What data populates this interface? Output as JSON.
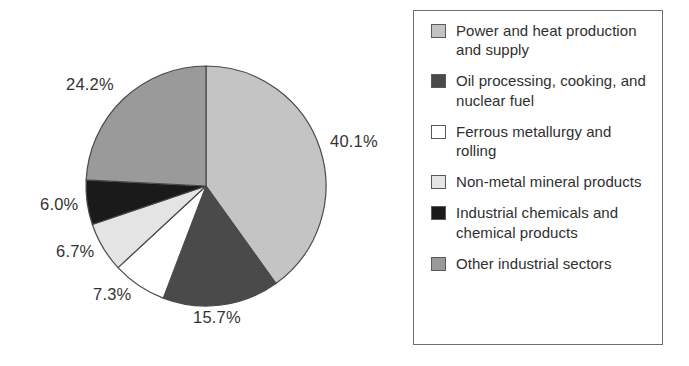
{
  "chart_data": {
    "type": "pie",
    "title": "",
    "subtitle": "",
    "xlabel": "",
    "ylabel": "",
    "units": "percent",
    "start_angle_deg": 0,
    "direction": "clockwise",
    "grid": false,
    "legend_position": "right",
    "legend_border": true,
    "categories": [
      "Power and heat production and supply",
      "Oil processing, cooking, and nuclear fuel",
      "Ferrous metallurgy and rolling",
      "Non-metal mineral products",
      "Industrial chemicals and chemical products",
      "Other industrial sectors"
    ],
    "values": [
      40.1,
      15.7,
      7.3,
      6.7,
      6.0,
      24.2
    ],
    "value_labels": [
      "40.1%",
      "15.7%",
      "7.3%",
      "6.7%",
      "6.0%",
      "24.2%"
    ],
    "colors": [
      "#c4c4c4",
      "#4a4a4a",
      "#ffffff",
      "#e4e4e4",
      "#1a1a1a",
      "#9a9a9a"
    ],
    "slice_outline_color": "#4a4a4a",
    "total": 100.0
  },
  "pie": {
    "center_x": 206,
    "center_y": 186,
    "radius": 120,
    "labels": [
      {
        "text": "24.2%",
        "x": 66,
        "y": 76
      },
      {
        "text": "40.1%",
        "x": 330,
        "y": 133
      },
      {
        "text": "6.0%",
        "x": 40,
        "y": 196
      },
      {
        "text": "6.7%",
        "x": 56,
        "y": 243
      },
      {
        "text": "7.3%",
        "x": 93,
        "y": 286
      },
      {
        "text": "15.7%",
        "x": 193,
        "y": 309
      }
    ]
  },
  "legend": {
    "items": [
      {
        "label": "Power and heat production and supply",
        "color": "#c4c4c4",
        "swatch_name": "legend-swatch-power-and-heat"
      },
      {
        "label": "Oil processing, cooking, and nuclear fuel",
        "color": "#4a4a4a",
        "swatch_name": "legend-swatch-oil-processing"
      },
      {
        "label": "Ferrous metallurgy and rolling",
        "color": "#ffffff",
        "swatch_name": "legend-swatch-ferrous-metallurgy"
      },
      {
        "label": "Non-metal mineral products",
        "color": "#e4e4e4",
        "swatch_name": "legend-swatch-non-metal-mineral"
      },
      {
        "label": "Industrial chemicals and chemical products",
        "color": "#1a1a1a",
        "swatch_name": "legend-swatch-industrial-chemicals"
      },
      {
        "label": "Other industrial sectors",
        "color": "#9a9a9a",
        "swatch_name": "legend-swatch-other-sectors"
      }
    ]
  }
}
